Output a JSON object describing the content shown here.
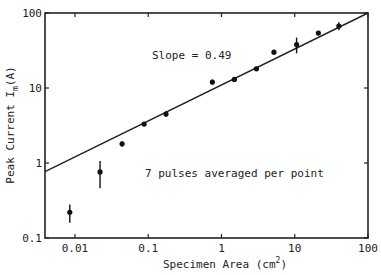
{
  "chart_data": {
    "type": "scatter",
    "title": "",
    "xlabel": "Specimen Area (cm²)",
    "xlabel_base": "Specimen Area (cm",
    "xlabel_sup": "2",
    "xlabel_end": ")",
    "ylabel": "Peak Current Im(A)",
    "ylabel_base": "Peak Current I",
    "ylabel_sub": "m",
    "ylabel_end": "(A)",
    "xscale": "log",
    "yscale": "log",
    "xlim": [
      0.0039,
      100
    ],
    "ylim": [
      0.1,
      100
    ],
    "x_ticks": [
      {
        "value": 0.01,
        "label": "0.01"
      },
      {
        "value": 0.1,
        "label": "0.1"
      },
      {
        "value": 1,
        "label": "1"
      },
      {
        "value": 10,
        "label": "10"
      },
      {
        "value": 100,
        "label": "100"
      }
    ],
    "y_ticks": [
      {
        "value": 0.1,
        "label": "0.1"
      },
      {
        "value": 1,
        "label": "1"
      },
      {
        "value": 10,
        "label": "10"
      },
      {
        "value": 100,
        "label": "100"
      }
    ],
    "grid": false,
    "legend": null,
    "series": [
      {
        "name": "measured",
        "points": [
          {
            "x": 0.0085,
            "y": 0.22,
            "err": 0.06
          },
          {
            "x": 0.022,
            "y": 0.76,
            "err": 0.3
          },
          {
            "x": 0.044,
            "y": 1.8,
            "err": 0.15
          },
          {
            "x": 0.088,
            "y": 3.3,
            "err": 0.2
          },
          {
            "x": 0.175,
            "y": 4.5,
            "err": 0.4
          },
          {
            "x": 0.75,
            "y": 12,
            "err": 1.0
          },
          {
            "x": 1.5,
            "y": 13,
            "err": 0.5
          },
          {
            "x": 3.0,
            "y": 18,
            "err": 1.0
          },
          {
            "x": 5.2,
            "y": 30,
            "err": 2.0
          },
          {
            "x": 10.6,
            "y": 38,
            "err": 9.0
          },
          {
            "x": 21,
            "y": 54,
            "err": 3.0
          },
          {
            "x": 40,
            "y": 67,
            "err": 8.0
          }
        ]
      }
    ],
    "fit_line": {
      "slope": 0.49,
      "x": [
        0.0039,
        100
      ],
      "y": [
        0.77,
        100
      ]
    },
    "annotations": [
      {
        "text": "Slope = 0.49",
        "x": 0.9,
        "y": 40
      },
      {
        "text": "7 pulses averaged per point",
        "x": 1.5,
        "y": 0.8
      }
    ]
  }
}
